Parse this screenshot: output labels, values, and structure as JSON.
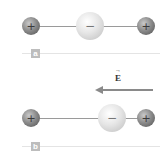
{
  "panels": [
    {
      "label": "a",
      "charges": [
        {
          "sign": "+",
          "type": "positive"
        },
        {
          "sign": "−",
          "type": "negative"
        },
        {
          "sign": "+",
          "type": "positive"
        }
      ]
    },
    {
      "label": "b",
      "field_label": "E",
      "field_vector_mark": "→",
      "field_direction": "left",
      "charges": [
        {
          "sign": "+",
          "type": "positive"
        },
        {
          "sign": "−",
          "type": "negative"
        },
        {
          "sign": "+",
          "type": "positive"
        }
      ]
    }
  ],
  "colors": {
    "positive_charge": "#6e6e6e",
    "negative_charge": "#e3e3e3",
    "field_arrow": "#8a8a8a",
    "label_box": "#bdbdbd"
  }
}
